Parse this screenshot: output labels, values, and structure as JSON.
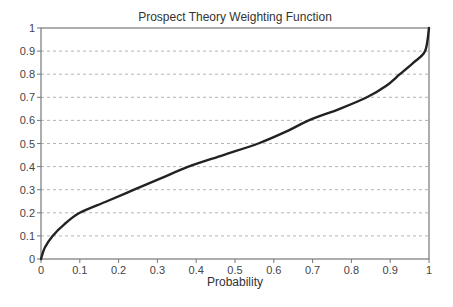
{
  "chart_data": {
    "type": "line",
    "title": "Prospect Theory Weighting Function",
    "xlabel": "Probability",
    "ylabel": "",
    "xlim": [
      0,
      1
    ],
    "ylim": [
      0,
      1
    ],
    "grid": {
      "horizontal": true,
      "vertical": false,
      "style": "dashed"
    },
    "legend": null,
    "x_ticks": [
      "0",
      "0.1",
      "0.2",
      "0.3",
      "0.4",
      "0.5",
      "0.6",
      "0.7",
      "0.8",
      "0.9",
      "1"
    ],
    "y_ticks": [
      "0",
      "0.1",
      "0.2",
      "0.3",
      "0.4",
      "0.5",
      "0.6",
      "0.7",
      "0.8",
      "0.9",
      "1"
    ],
    "series": [
      {
        "name": "Weighting function",
        "color": "#222222",
        "x": [
          0,
          0.01,
          0.03,
          0.06,
          0.1,
          0.17,
          0.24,
          0.31,
          0.38,
          0.47,
          0.56,
          0.63,
          0.69,
          0.77,
          0.84,
          0.89,
          0.925,
          0.96,
          0.99,
          1.0
        ],
        "y": [
          0,
          0.05,
          0.1,
          0.15,
          0.2,
          0.25,
          0.3,
          0.35,
          0.4,
          0.45,
          0.5,
          0.55,
          0.6,
          0.65,
          0.7,
          0.75,
          0.8,
          0.85,
          0.9,
          1.0
        ]
      }
    ]
  }
}
